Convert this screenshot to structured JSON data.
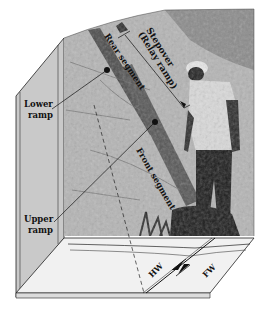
{
  "figure": {
    "type": "block-diagram-with-photograph",
    "labels": {
      "stepover": "Stepover",
      "relay_ramp": "(Relay ramp)",
      "rear_segment": "Rear segment",
      "front_segment": "Front segment",
      "lower_ramp_1": "Lower",
      "lower_ramp_2": "ramp",
      "upper_ramp_1": "Upper",
      "upper_ramp_2": "ramp",
      "hanging_wall": "HW",
      "footwall": "FW"
    },
    "colors": {
      "side_face": "#c9c9c9",
      "base_face": "#f1f1f1",
      "photo_light": "#b9b9b9",
      "photo_dark": "#3a3a3a",
      "ink": "#111111"
    }
  }
}
